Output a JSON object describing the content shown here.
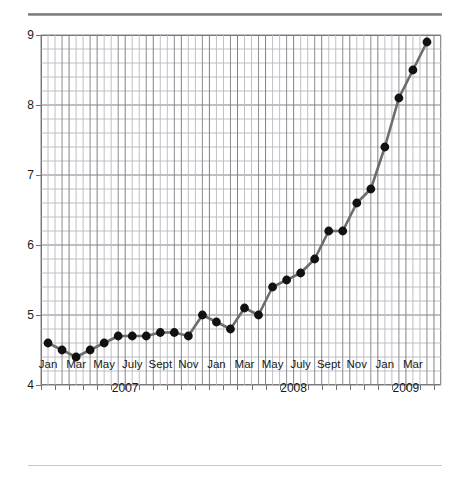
{
  "chart_data": {
    "type": "line",
    "title": "",
    "xlabel": "",
    "ylabel": "",
    "ylim": [
      4,
      9
    ],
    "y_major_ticks": [
      4,
      5,
      6,
      7,
      8,
      9
    ],
    "y_minor_step": 0.2,
    "grid": true,
    "legend": "none",
    "marker": "filled-circle",
    "line_color": "#6d6d6d",
    "marker_color": "#111111",
    "grid_color": "#b9b9bf",
    "grid_major_color": "#808088",
    "axis_color": "#6f6f6f",
    "x": [
      "Jan 2007",
      "Feb 2007",
      "Mar 2007",
      "Apr 2007",
      "May 2007",
      "June 2007",
      "July 2007",
      "Aug 2007",
      "Sept 2007",
      "Oct 2007",
      "Nov 2007",
      "Dec 2007",
      "Jan 2008",
      "Feb 2008",
      "Mar 2008",
      "Apr 2008",
      "May 2008",
      "June 2008",
      "July 2008",
      "Aug 2008",
      "Sept 2008",
      "Oct 2008",
      "Nov 2008",
      "Dec 2008",
      "Jan 2009",
      "Feb 2009",
      "Mar 2009",
      "Apr 2009"
    ],
    "values": [
      4.6,
      4.5,
      4.4,
      4.5,
      4.6,
      4.7,
      4.7,
      4.7,
      4.75,
      4.75,
      4.7,
      5.0,
      4.9,
      4.8,
      5.1,
      5.0,
      5.4,
      5.5,
      5.6,
      5.8,
      6.2,
      6.2,
      6.6,
      6.8,
      7.4,
      8.1,
      8.5,
      8.9
    ],
    "x_tick_labels": [
      {
        "label": "Jan",
        "index": 0
      },
      {
        "label": "Mar",
        "index": 2
      },
      {
        "label": "May",
        "index": 4
      },
      {
        "label": "July",
        "index": 6
      },
      {
        "label": "Sept",
        "index": 8
      },
      {
        "label": "Nov",
        "index": 10
      },
      {
        "label": "Jan",
        "index": 12
      },
      {
        "label": "Mar",
        "index": 14
      },
      {
        "label": "May",
        "index": 16
      },
      {
        "label": "July",
        "index": 18
      },
      {
        "label": "Sept",
        "index": 20
      },
      {
        "label": "Nov",
        "index": 22
      },
      {
        "label": "Jan",
        "index": 24
      },
      {
        "label": "Mar",
        "index": 26
      }
    ],
    "year_groups": [
      {
        "label": "2007",
        "center_index": 5.5
      },
      {
        "label": "2008",
        "center_index": 17.5
      },
      {
        "label": "2009",
        "center_index": 25.5
      }
    ]
  }
}
